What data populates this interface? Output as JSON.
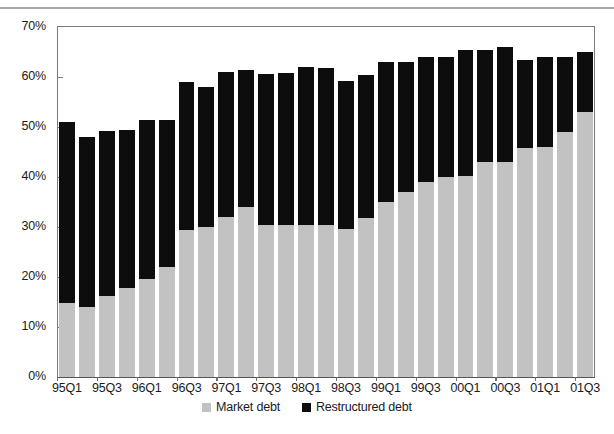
{
  "chart_data": {
    "type": "bar",
    "stacked": true,
    "title": "",
    "subtitle": "",
    "xlabel": "",
    "ylabel": "",
    "ylim": [
      0,
      70
    ],
    "ytick_values": [
      0,
      10,
      20,
      30,
      40,
      50,
      60,
      70
    ],
    "ytick_labels": [
      "0%",
      "10%",
      "20%",
      "30%",
      "40%",
      "50%",
      "60%",
      "70%"
    ],
    "grid": false,
    "legend_position": "bottom-center",
    "categories": [
      "95Q1",
      "95Q2",
      "95Q3",
      "95Q4",
      "96Q1",
      "96Q2",
      "96Q3",
      "96Q4",
      "97Q1",
      "97Q2",
      "97Q3",
      "97Q4",
      "98Q1",
      "98Q2",
      "98Q3",
      "98Q4",
      "99Q1",
      "99Q2",
      "99Q3",
      "99Q4",
      "00Q1",
      "00Q2",
      "00Q3",
      "00Q4",
      "01Q1",
      "01Q2",
      "01Q3"
    ],
    "xtick_labels": [
      "95Q1",
      "95Q3",
      "96Q1",
      "96Q3",
      "97Q1",
      "97Q3",
      "98Q1",
      "98Q3",
      "99Q1",
      "99Q3",
      "00Q1",
      "00Q3",
      "01Q1",
      "01Q3"
    ],
    "xtick_category_indices": [
      0,
      2,
      4,
      6,
      8,
      10,
      12,
      14,
      16,
      18,
      20,
      22,
      24,
      26
    ],
    "series": [
      {
        "name": "Market debt",
        "color": "#c2c2c2",
        "values": [
          14.8,
          14.0,
          16.3,
          17.8,
          19.7,
          22.0,
          29.5,
          30.0,
          32.0,
          34.0,
          30.5,
          30.5,
          30.5,
          30.5,
          29.7,
          31.8,
          35.0,
          37.0,
          39.0,
          40.0,
          40.3,
          43.0,
          43.0,
          45.8,
          46.0,
          49.0,
          53.0
        ]
      },
      {
        "name": "Restructured debt",
        "color": "#0d0d0d",
        "values": [
          36.2,
          34.0,
          33.0,
          31.6,
          31.8,
          29.5,
          29.5,
          28.0,
          29.0,
          27.5,
          30.2,
          30.3,
          31.5,
          31.3,
          29.5,
          28.7,
          28.0,
          26.0,
          25.0,
          24.0,
          25.2,
          22.5,
          23.0,
          17.7,
          18.0,
          15.0,
          12.0
        ]
      }
    ],
    "totals": [
      51.0,
      48.0,
      49.3,
      49.4,
      51.5,
      51.5,
      59.0,
      58.0,
      61.0,
      61.5,
      60.7,
      60.8,
      62.0,
      61.8,
      59.2,
      60.5,
      63.0,
      63.0,
      64.0,
      64.0,
      65.5,
      65.5,
      66.0,
      63.5,
      64.0,
      64.0,
      65.0
    ]
  },
  "legend": {
    "items": [
      {
        "label": "Market debt",
        "color": "#c2c2c2"
      },
      {
        "label": "Restructured debt",
        "color": "#0d0d0d"
      }
    ]
  }
}
